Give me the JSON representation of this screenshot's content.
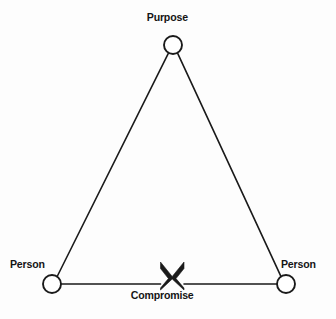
{
  "diagram": {
    "background_color": "#fdfdfd",
    "stroke_color": "#1a1a1a",
    "nodes": [
      {
        "id": "purpose",
        "label": "Purpose",
        "shape": "circle",
        "cx": 173,
        "cy": 45,
        "r": 9,
        "label_position": "above"
      },
      {
        "id": "person-left",
        "label": "Person",
        "shape": "circle",
        "cx": 52,
        "cy": 284,
        "r": 9,
        "label_position": "upper-left"
      },
      {
        "id": "person-right",
        "label": "Person",
        "shape": "circle",
        "cx": 286,
        "cy": 284,
        "r": 9,
        "label_position": "upper-right"
      }
    ],
    "edges": [
      {
        "id": "edge-purpose-person-left",
        "from": "purpose",
        "to": "person-left"
      },
      {
        "id": "edge-purpose-person-right",
        "from": "purpose",
        "to": "person-right"
      },
      {
        "id": "edge-person-left-person-right",
        "from": "person-left",
        "to": "person-right"
      }
    ],
    "markers": [
      {
        "id": "compromise-x",
        "glyph": "x-bowtie",
        "label": "Compromise",
        "cx": 172,
        "cy": 272,
        "on_edge": "edge-person-left-person-right",
        "label_position": "below"
      }
    ]
  }
}
